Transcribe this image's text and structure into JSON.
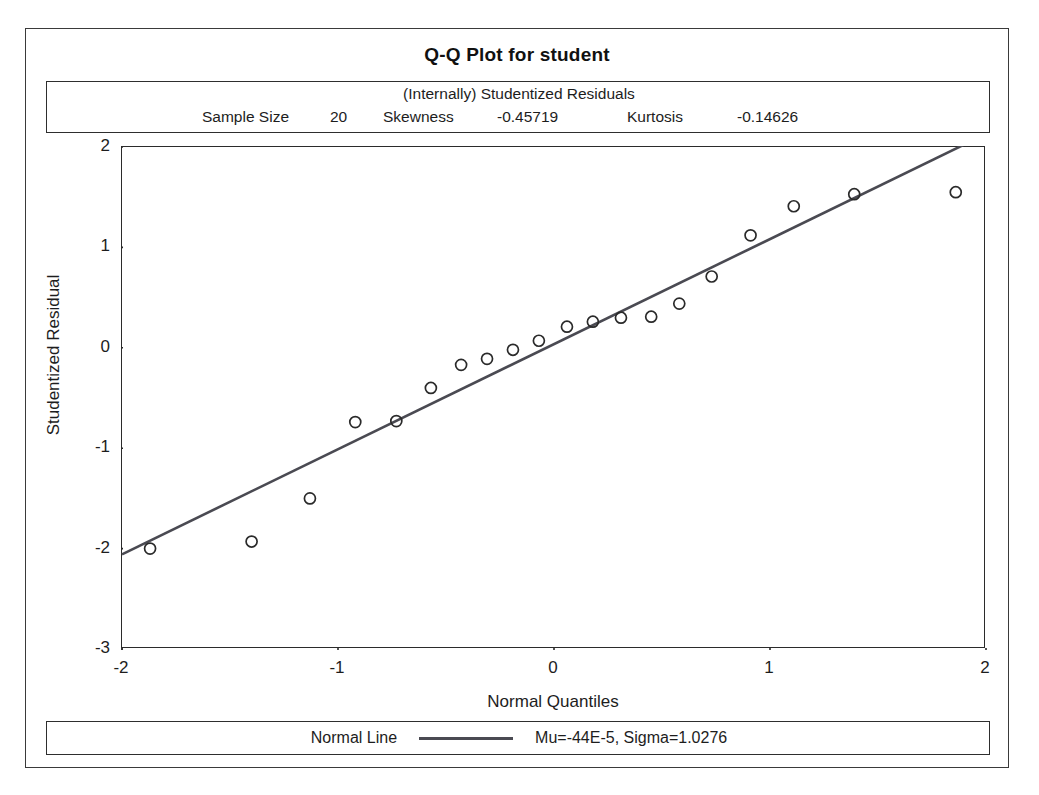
{
  "title": "Q-Q Plot for student",
  "stats": {
    "subtitle": "(Internally) Studentized Residuals",
    "sample_size_label": "Sample Size",
    "sample_size_value": "20",
    "skewness_label": "Skewness",
    "skewness_value": "-0.45719",
    "kurtosis_label": "Kurtosis",
    "kurtosis_value": "-0.14626"
  },
  "legend": {
    "series_label": "Normal Line",
    "params_label": "Mu=-44E-5, Sigma=1.0276",
    "line_swatch_name": "normal-line-swatch"
  },
  "axes": {
    "x_title": "Normal Quantiles",
    "y_title": "Studentized Residual",
    "x_ticks": [
      "-2",
      "-1",
      "0",
      "1",
      "2"
    ],
    "y_ticks": [
      "2",
      "1",
      "0",
      "-1",
      "-2",
      "-3"
    ]
  },
  "colors": {
    "frame": "#2b2b2b",
    "text": "#1d1d1d",
    "marker_stroke": "#2a2a2a",
    "line": "#4a4a52",
    "background": "#ffffff"
  },
  "chart_data": {
    "type": "scatter",
    "title": "Q-Q Plot for student",
    "subtitle": "(Internally) Studentized Residuals",
    "xlabel": "Normal Quantiles",
    "ylabel": "Studentized Residual",
    "xlim": [
      -2.0,
      2.0
    ],
    "ylim": [
      -3.0,
      2.0
    ],
    "xticks": [
      -2,
      -1,
      0,
      1,
      2
    ],
    "yticks": [
      -3,
      -2,
      -1,
      0,
      1,
      2
    ],
    "grid": false,
    "legend_position": "bottom",
    "marker": "open-circle",
    "sample_size": 20,
    "skewness": -0.45719,
    "kurtosis": -0.14626,
    "normal_line": {
      "name": "Normal Line",
      "mu": -0.00044,
      "sigma": 1.0276,
      "label": "Mu=-44E-5, Sigma=1.0276",
      "endpoints": [
        [
          -2.06,
          -2.12
        ],
        [
          2.0,
          2.13
        ]
      ]
    },
    "series": [
      {
        "name": "Studentized Residuals",
        "points": [
          [
            -1.87,
            -2.0
          ],
          [
            -1.4,
            -1.93
          ],
          [
            -1.13,
            -1.5
          ],
          [
            -0.92,
            -0.74
          ],
          [
            -0.73,
            -0.73
          ],
          [
            -0.57,
            -0.4
          ],
          [
            -0.43,
            -0.17
          ],
          [
            -0.31,
            -0.11
          ],
          [
            -0.19,
            -0.02
          ],
          [
            -0.07,
            0.07
          ],
          [
            0.06,
            0.21
          ],
          [
            0.18,
            0.26
          ],
          [
            0.31,
            0.3
          ],
          [
            0.45,
            0.31
          ],
          [
            0.58,
            0.44
          ],
          [
            0.73,
            0.71
          ],
          [
            0.91,
            1.12
          ],
          [
            1.11,
            1.41
          ],
          [
            1.39,
            1.53
          ],
          [
            1.86,
            1.55
          ]
        ]
      }
    ]
  }
}
